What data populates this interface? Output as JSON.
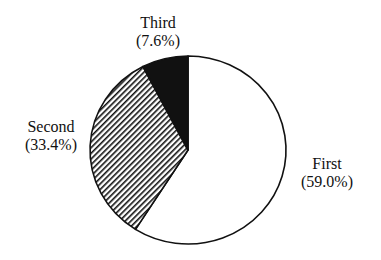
{
  "chart_data": {
    "type": "pie",
    "title": "",
    "categories": [
      "First",
      "Second",
      "Third"
    ],
    "values": [
      59.0,
      33.4,
      7.6
    ],
    "units": "%",
    "fills": [
      "white",
      "diagonal-hatch",
      "black"
    ],
    "start_angle": "12 o'clock",
    "direction": "clockwise",
    "labels": [
      {
        "name": "First",
        "pct": "(59.0%)"
      },
      {
        "name": "Second",
        "pct": "(33.4%)"
      },
      {
        "name": "Third",
        "pct": "(7.6%)"
      }
    ]
  },
  "colors": {
    "outline": "#111111",
    "third_fill": "#111111",
    "background": "#ffffff"
  }
}
